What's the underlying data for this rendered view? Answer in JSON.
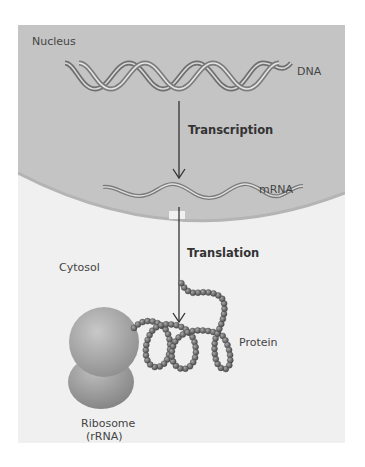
{
  "figure": {
    "compartments": {
      "nucleus": "Nucleus",
      "cytosol": "Cytosol"
    },
    "molecules": {
      "dna": "DNA",
      "mrna": "mRNA",
      "protein": "Protein",
      "ribosome_line1": "Ribosome",
      "ribosome_line2": "(rRNA)"
    },
    "processes": {
      "transcription": "Transcription",
      "translation": "Translation"
    },
    "colors": {
      "nucleus_fill": "#c4c4c4",
      "cytosol_fill": "#f0f0f0",
      "arrow": "#333333",
      "protein_bead": "#7a7a7a",
      "ribosome": "#a8a8a8"
    }
  }
}
